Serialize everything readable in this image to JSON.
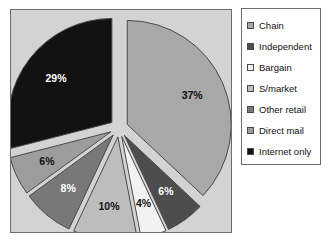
{
  "chart_data": {
    "type": "pie",
    "title": "",
    "subtitle": "",
    "xlabel": "",
    "ylabel": "",
    "exploded": true,
    "grid": false,
    "legend_position": "right",
    "categories": [
      "Chain",
      "Independent",
      "Bargain",
      "S/market",
      "Other retail",
      "Direct mail",
      "Internet only"
    ],
    "values": [
      37,
      6,
      4,
      10,
      8,
      6,
      29
    ],
    "value_labels": [
      "37%",
      "6%",
      "4%",
      "10%",
      "8%",
      "6%",
      "29%"
    ],
    "colors": [
      "#a8a8a8",
      "#4d4d4d",
      "#f2f2f2",
      "#bdbdbd",
      "#787878",
      "#9c9c9c",
      "#121212"
    ],
    "label_text_colors": [
      "#111111",
      "#ffffff",
      "#111111",
      "#111111",
      "#ffffff",
      "#111111",
      "#ffffff"
    ],
    "units": "percent"
  },
  "plot": {
    "background_color": "#d3d3d3",
    "border_color": "#6e6e6e"
  },
  "legend": {
    "background_color": "#ffffff",
    "border_color": "#6e6e6e",
    "items": [
      {
        "label": "Chain",
        "color": "#a8a8a8"
      },
      {
        "label": "Independent",
        "color": "#4d4d4d"
      },
      {
        "label": "Bargain",
        "color": "#f2f2f2"
      },
      {
        "label": "S/market",
        "color": "#bdbdbd"
      },
      {
        "label": "Other retail",
        "color": "#787878"
      },
      {
        "label": "Direct mail",
        "color": "#9c9c9c"
      },
      {
        "label": "Internet only",
        "color": "#121212"
      }
    ]
  }
}
